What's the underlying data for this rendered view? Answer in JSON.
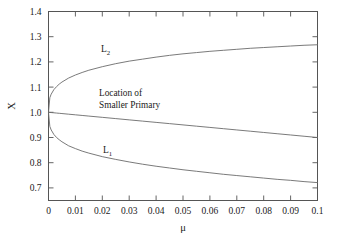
{
  "chart_data": {
    "type": "line",
    "title": "",
    "xlabel": "μ",
    "ylabel": "X",
    "xlim": [
      0,
      0.1
    ],
    "ylim": [
      0.65,
      1.4
    ],
    "grid": false,
    "legend": "inline-annotations",
    "xticks": [
      "0",
      "0.01",
      "0.02",
      "0.03",
      "0.04",
      "0.05",
      "0.06",
      "0.07",
      "0.08",
      "0.09",
      "0.1"
    ],
    "xtick_values": [
      0,
      0.01,
      0.02,
      0.03,
      0.04,
      0.05,
      0.06,
      0.07,
      0.08,
      0.09,
      0.1
    ],
    "yticks": [
      "0.7",
      "0.8",
      "0.9",
      "1.0",
      "1.1",
      "1.2",
      "1.3",
      "1.4"
    ],
    "ytick_values": [
      0.7,
      0.8,
      0.9,
      1.0,
      1.1,
      1.2,
      1.3,
      1.4
    ],
    "x": [
      0.0,
      0.0005,
      0.001,
      0.002,
      0.003,
      0.004,
      0.005,
      0.0075,
      0.01,
      0.0125,
      0.015,
      0.02,
      0.025,
      0.03,
      0.035,
      0.04,
      0.045,
      0.05,
      0.055,
      0.06,
      0.065,
      0.07,
      0.075,
      0.08,
      0.085,
      0.09,
      0.095,
      0.1
    ],
    "series": [
      {
        "name": "L2",
        "label": "L₂",
        "label_at": {
          "x": 0.0245,
          "y": 1.255
        },
        "values": [
          1.0,
          1.058,
          1.072,
          1.09,
          1.102,
          1.112,
          1.12,
          1.136,
          1.148,
          1.158,
          1.167,
          1.181,
          1.193,
          1.203,
          1.211,
          1.219,
          1.226,
          1.232,
          1.237,
          1.242,
          1.246,
          1.25,
          1.254,
          1.257,
          1.26,
          1.263,
          1.266,
          1.268
        ]
      },
      {
        "name": "Smaller Primary",
        "label": "Location of\nSmaller Primary",
        "label_at": {
          "x": 0.0245,
          "y": 1.075
        },
        "values": [
          1.0,
          0.9995,
          0.999,
          0.998,
          0.997,
          0.996,
          0.995,
          0.9925,
          0.99,
          0.9875,
          0.985,
          0.98,
          0.975,
          0.97,
          0.965,
          0.96,
          0.955,
          0.95,
          0.945,
          0.94,
          0.935,
          0.93,
          0.925,
          0.92,
          0.915,
          0.91,
          0.905,
          0.9
        ]
      },
      {
        "name": "L1",
        "label": "L₁",
        "label_at": {
          "x": 0.0255,
          "y": 0.815
        },
        "values": [
          1.0,
          0.944,
          0.93,
          0.912,
          0.9,
          0.891,
          0.883,
          0.867,
          0.856,
          0.846,
          0.838,
          0.824,
          0.813,
          0.803,
          0.794,
          0.786,
          0.779,
          0.772,
          0.766,
          0.76,
          0.754,
          0.749,
          0.744,
          0.739,
          0.734,
          0.73,
          0.725,
          0.721
        ]
      }
    ],
    "annotations": [
      {
        "id": "primary-annotation-line1",
        "text": "Location of"
      },
      {
        "id": "primary-annotation-line2",
        "text": "Smaller Primary"
      }
    ],
    "colors": {
      "curve": "#6b6b6b",
      "axis": "#555555",
      "text": "#1a1a1a",
      "background": "#ffffff"
    }
  },
  "axis": {
    "x_title": "μ",
    "y_title": "X"
  },
  "labels": {
    "l2_main": "L",
    "l2_sub": "2",
    "l1_main": "L",
    "l1_sub": "1",
    "annotation_line1": "Location of",
    "annotation_line2": "Smaller Primary"
  }
}
